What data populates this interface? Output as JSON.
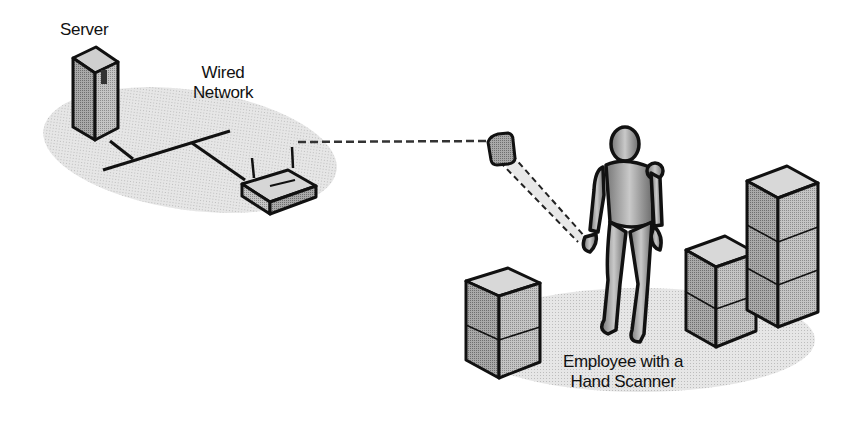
{
  "diagram": {
    "labels": {
      "server": "Server",
      "wired_network_line1": "Wired",
      "wired_network_line2": "Network",
      "employee_line1": "Employee with a",
      "employee_line2": "Hand Scanner"
    },
    "nodes": [
      {
        "id": "server",
        "icon": "server-tower-icon"
      },
      {
        "id": "router",
        "icon": "wireless-access-point-icon"
      },
      {
        "id": "scanner",
        "icon": "hand-scanner-icon"
      },
      {
        "id": "employee",
        "icon": "person-figure-icon"
      },
      {
        "id": "box-left",
        "icon": "stacked-boxes-icon"
      },
      {
        "id": "box-middle",
        "icon": "stacked-boxes-icon"
      },
      {
        "id": "box-tall",
        "icon": "stacked-boxes-icon"
      }
    ],
    "edges": [
      {
        "from": "server",
        "to": "router",
        "style": "solid"
      },
      {
        "from": "router",
        "to": "scanner",
        "style": "dashed"
      },
      {
        "from": "scanner",
        "to": "employee",
        "style": "beam"
      }
    ],
    "colors": {
      "outline": "#111111",
      "floor": "#e3e3e3",
      "device_fill": "#bdbdbd",
      "device_dark": "#8a8a8a"
    }
  }
}
